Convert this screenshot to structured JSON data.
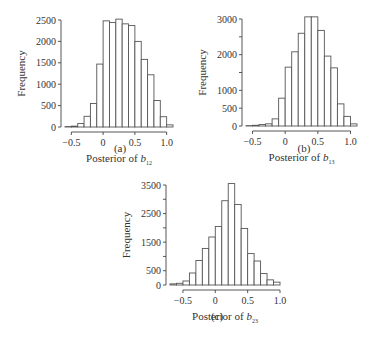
{
  "chart_data": [
    {
      "id": "a",
      "type": "bar",
      "caption": "(a)",
      "title": "",
      "xlabel": "Posterior of b",
      "xlabel_subscript": "12",
      "ylabel": "Frequency",
      "bin_width": 0.1,
      "bin_starts": [
        -0.6,
        -0.5,
        -0.4,
        -0.3,
        -0.2,
        -0.1,
        0.0,
        0.1,
        0.2,
        0.3,
        0.4,
        0.5,
        0.6,
        0.7,
        0.8,
        0.9,
        1.0
      ],
      "values": [
        10,
        20,
        80,
        250,
        550,
        1470,
        2480,
        2440,
        2520,
        2410,
        2370,
        2000,
        1580,
        1220,
        620,
        240,
        50
      ],
      "xlim": [
        -0.6,
        1.1
      ],
      "ylim": [
        0,
        2500
      ],
      "xticks": [
        -0.5,
        0,
        0.5,
        1.0
      ],
      "xtick_labels": [
        "−0.5",
        "0",
        "0.5",
        "1.0"
      ],
      "yticks": [
        0,
        500,
        1000,
        1500,
        2000,
        2500
      ],
      "ytick_labels": [
        "0",
        "500",
        "1000",
        "1500",
        "2000",
        "2500"
      ],
      "grid": false,
      "bar_fill": "#ffffff",
      "bar_stroke": "#555555"
    },
    {
      "id": "b",
      "type": "bar",
      "caption": "(b)",
      "title": "",
      "xlabel": "Posterior of b",
      "xlabel_subscript": "13",
      "ylabel": "Frequency",
      "bin_width": 0.1,
      "bin_starts": [
        -0.6,
        -0.5,
        -0.4,
        -0.3,
        -0.2,
        -0.1,
        0.0,
        0.1,
        0.2,
        0.3,
        0.4,
        0.5,
        0.6,
        0.7,
        0.8,
        0.9,
        1.0
      ],
      "values": [
        10,
        20,
        40,
        60,
        200,
        780,
        1650,
        2080,
        2600,
        3180,
        3100,
        2680,
        1960,
        1630,
        620,
        270,
        60
      ],
      "xlim": [
        -0.6,
        1.1
      ],
      "ylim": [
        0,
        3000
      ],
      "xticks": [
        -0.5,
        0,
        0.5,
        1.0
      ],
      "xtick_labels": [
        "−0.5",
        "0",
        "0.5",
        "1.0"
      ],
      "yticks": [
        0,
        500,
        1000,
        1500,
        2000,
        2500,
        3000
      ],
      "ytick_labels": [
        "0",
        "500",
        "1000",
        "",
        "2000",
        "",
        "3000"
      ],
      "grid": false,
      "bar_fill": "#ffffff",
      "bar_stroke": "#555555"
    },
    {
      "id": "c",
      "type": "bar",
      "caption": "(c)",
      "title": "",
      "xlabel": "Posterior of b",
      "xlabel_subscript": "23",
      "ylabel": "Frequency",
      "bin_width": 0.1,
      "bin_starts": [
        -0.7,
        -0.6,
        -0.5,
        -0.4,
        -0.3,
        -0.2,
        -0.1,
        0.0,
        0.1,
        0.2,
        0.3,
        0.4,
        0.5,
        0.6,
        0.7,
        0.8,
        0.9
      ],
      "values": [
        40,
        60,
        140,
        420,
        860,
        1280,
        1680,
        2050,
        2950,
        3550,
        2820,
        1980,
        1100,
        840,
        400,
        180,
        100
      ],
      "xlim": [
        -0.7,
        1.0
      ],
      "ylim": [
        0,
        3500
      ],
      "xticks": [
        -0.5,
        0,
        0.5,
        1.0
      ],
      "xtick_labels": [
        "−0.5",
        "0",
        "0.5",
        "1.0"
      ],
      "yticks": [
        0,
        500,
        1000,
        1500,
        2000,
        2500,
        3000,
        3500
      ],
      "ytick_labels": [
        "0",
        "500",
        "",
        "1500",
        "",
        "2500",
        "",
        "3500"
      ],
      "grid": false,
      "bar_fill": "#ffffff",
      "bar_stroke": "#555555"
    }
  ]
}
